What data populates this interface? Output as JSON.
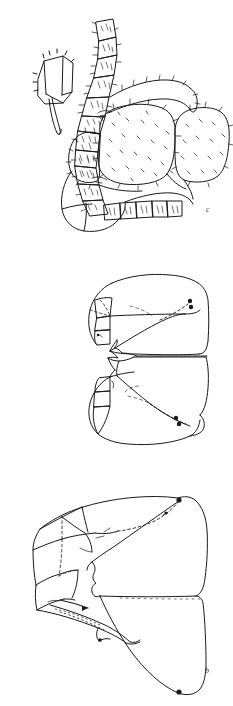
{
  "plate": {
    "title": "Scientific line-drawing plate",
    "background_color": "#ffffff",
    "ink_color": "#1a1a1a",
    "width": 233,
    "height": 706,
    "panel_count": 3
  },
  "panels": [
    {
      "id": "panel-c",
      "label": "c",
      "caption": "",
      "subject": "lateral habitus with segmented appendage and setose body segments",
      "position": "top",
      "label_position": {
        "x": 206,
        "y": 206
      },
      "features": [
        "segmented palp / leg with annulated articles",
        "dense short setae over body surface",
        "large rounded idiosoma segments",
        "ventral row of rectangular segments"
      ]
    },
    {
      "id": "panel-b",
      "label": "b",
      "caption": "",
      "subject": "paired symmetric sclerites with dotted sutures and dark spots",
      "position": "middle",
      "label_position": {
        "x": 205,
        "y": 427
      },
      "features": [
        "mirrored upper and lower sclerite plates",
        "dashed internal suture lines",
        "two dark setal insertion points on each half"
      ]
    },
    {
      "id": "panel-a",
      "label": "a",
      "caption": "",
      "subject": "lateral view of large sclerite with dotted margins and spur",
      "position": "bottom",
      "label_position": {
        "x": 207,
        "y": 662
      },
      "features": [
        "angular dorsal plate with dashed fold line",
        "elongate ventral spur process",
        "dark marginal nodes at apices"
      ]
    }
  ],
  "icons": {
    "figure_panel": "line-drawing-icon"
  }
}
